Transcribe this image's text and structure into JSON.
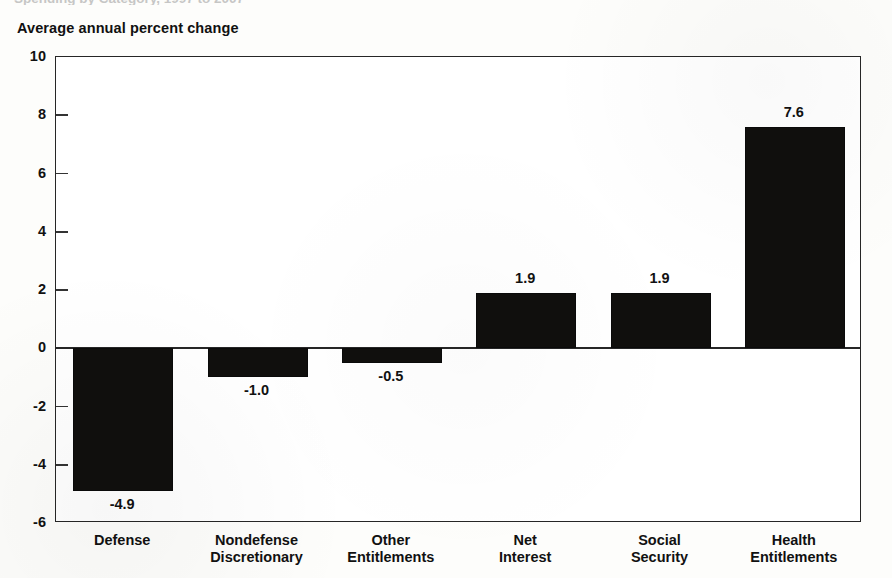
{
  "figure": {
    "cut_off_caption": "Spending by Category, 1997 to 2007",
    "axis_title": "Average annual percent change"
  },
  "chart_data": {
    "type": "bar",
    "title": "Average annual percent change",
    "xlabel": "",
    "ylabel": "Average annual percent change",
    "ylim": [
      -6,
      10
    ],
    "yticks": [
      10,
      8,
      6,
      4,
      2,
      0,
      -2,
      -4,
      -6
    ],
    "ytick_labels": [
      "10",
      "8",
      "6",
      "4",
      "2",
      "0",
      "-2",
      "-4",
      "-6"
    ],
    "grid": false,
    "legend": false,
    "bar_color": "#100f0d",
    "categories": [
      "Defense",
      "Nondefense\nDiscretionary",
      "Other\nEntitlements",
      "Net\nInterest",
      "Social\nSecurity",
      "Health\nEntitlements"
    ],
    "values": [
      -4.9,
      -1.0,
      -0.5,
      1.9,
      1.9,
      7.6
    ],
    "value_labels": [
      "-4.9",
      "-1.0",
      "-0.5",
      "1.9",
      "1.9",
      "7.6"
    ]
  }
}
